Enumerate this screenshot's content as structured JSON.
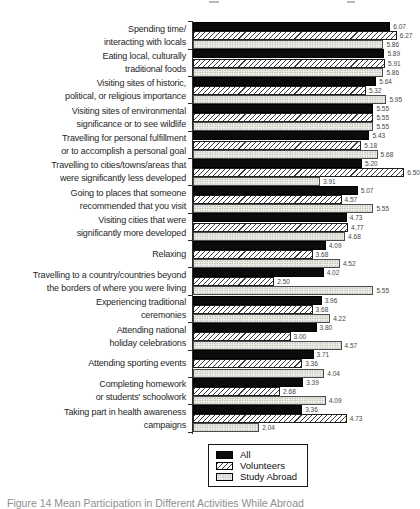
{
  "figure": {
    "caption_partial": "Figure 14 Mean Participation in Different Activities While Abroad"
  },
  "chart_data": {
    "type": "bar",
    "orientation": "horizontal",
    "value_range": [
      0,
      6.5
    ],
    "grid": false,
    "value_labels_shown": true,
    "legend": {
      "position": "bottom-center",
      "entries": [
        "All",
        "Volunteers",
        "Study Abroad"
      ]
    },
    "categories": [
      [
        "Spending time/",
        "interacting with locals"
      ],
      [
        "Eating local, culturally",
        "traditional foods"
      ],
      [
        "Visiting sites of historic,",
        "political, or religious importance"
      ],
      [
        "Visiting sites of environmental",
        "significance or to see wildlife"
      ],
      [
        "Travelling for personal fulfillment",
        "or to accomplish a personal goal"
      ],
      [
        "Travelling to cities/towns/areas that",
        "were significantly less developed"
      ],
      [
        "Going to places that someone",
        "recommended that you visit"
      ],
      [
        "Visiting cities that were",
        "significantly more developed"
      ],
      [
        "Relaxing"
      ],
      [
        "Travelling to a country/countries beyond",
        "the borders of where you were living"
      ],
      [
        "Experiencing traditional",
        "ceremonies"
      ],
      [
        "Attending national",
        "holiday celebrations"
      ],
      [
        "Attending sporting events"
      ],
      [
        "Completing homework",
        "or students' schoolwork"
      ],
      [
        "Taking part in health awareness",
        "campaigns"
      ]
    ],
    "series": [
      {
        "name": "All",
        "style": "solid-black",
        "values": [
          6.07,
          5.89,
          5.64,
          5.55,
          5.43,
          5.2,
          5.07,
          4.73,
          4.09,
          4.02,
          3.96,
          3.8,
          3.71,
          3.39,
          3.36
        ]
      },
      {
        "name": "Volunteers",
        "style": "diagonal-hatch",
        "values": [
          6.27,
          5.91,
          5.32,
          5.55,
          5.18,
          6.5,
          4.57,
          4.77,
          3.68,
          2.5,
          3.68,
          3.0,
          3.36,
          2.68,
          4.73
        ]
      },
      {
        "name": "Study Abroad",
        "style": "stipple",
        "values": [
          5.86,
          5.86,
          5.95,
          5.55,
          5.68,
          3.91,
          5.55,
          4.68,
          4.52,
          5.55,
          4.22,
          4.57,
          4.04,
          4.09,
          2.04
        ]
      }
    ]
  }
}
